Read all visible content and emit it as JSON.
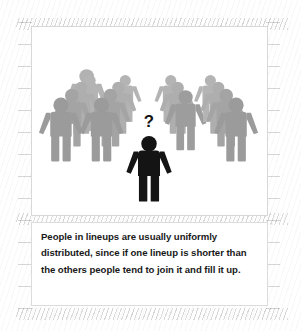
{
  "illustration": {
    "title_alt": "crowd-of-people-in-lineups-diagram",
    "colors": {
      "crowd_gray": "#9e9e9e",
      "crowd_gray_back": "#b0b0b0",
      "focus_black": "#141414",
      "card_background": "#ffffff",
      "card_border": "#d8d8d8",
      "page_background": "#ffffff",
      "caption_text": "#191919"
    },
    "focus_person": {
      "label": "undecided-person",
      "color": "#141414",
      "thought_glyph": "?"
    },
    "lineups": [
      {
        "name": "lineup-1",
        "position": "far-left",
        "direction": "receding-up-right",
        "people_count": 4
      },
      {
        "name": "lineup-2",
        "position": "center-left",
        "direction": "receding-up-right",
        "people_count": 4
      },
      {
        "name": "lineup-3",
        "position": "center-right",
        "direction": "receding-up-left",
        "people_count": 3
      },
      {
        "name": "lineup-4",
        "position": "far-right",
        "direction": "receding-up-left",
        "people_count": 4
      }
    ],
    "total_people_in_lineups": 15
  },
  "caption": {
    "text": "People in lineups are usually uniformly distributed, since if one lineup is shorter than the others people tend to join it and fill it up.",
    "lines": [
      "People in lineups are usually uniformly",
      "distributed, since if one lineup is shorter",
      "than the others people tend to join it and",
      "fill it up."
    ]
  }
}
